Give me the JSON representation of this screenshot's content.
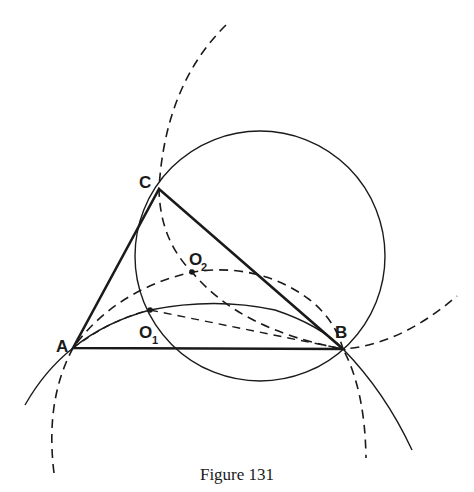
{
  "figure": {
    "caption": "Figure 131",
    "ink_color": "#1a1a1a",
    "background": "#ffffff"
  },
  "points": {
    "A": {
      "label": "A",
      "x": 73,
      "y": 348
    },
    "B": {
      "label": "B",
      "x": 343,
      "y": 349
    },
    "C": {
      "label": "C",
      "x": 159,
      "y": 189
    },
    "O1": {
      "label": "O",
      "sub": "1",
      "x": 150,
      "y": 310
    },
    "O2": {
      "label": "O",
      "sub": "2",
      "x": 192,
      "y": 272
    }
  },
  "elements": [
    {
      "name": "triangle-ABC",
      "style": "thick solid"
    },
    {
      "name": "circle-through-C-and-B",
      "style": "solid",
      "center": [
        260,
        256
      ],
      "radius": 125
    },
    {
      "name": "arc-A-O1-B",
      "style": "solid"
    },
    {
      "name": "arc-A-O2-B",
      "style": "dashed"
    },
    {
      "name": "arc-C-O2-B",
      "style": "dashed"
    },
    {
      "name": "segment-A-O1",
      "style": "dashed"
    },
    {
      "name": "segment-O1-B",
      "style": "dashed"
    }
  ]
}
